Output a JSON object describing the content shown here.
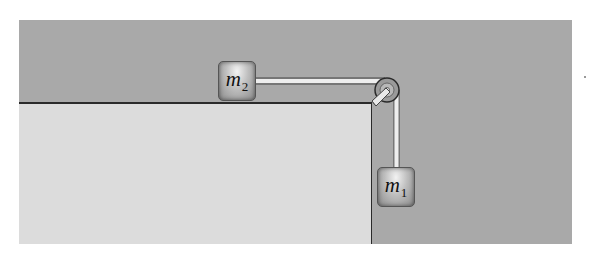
{
  "diagram": {
    "type": "pulley-system",
    "blocks": [
      {
        "id": "m2",
        "symbol": "m",
        "subscript": "2",
        "position": "on table surface"
      },
      {
        "id": "m1",
        "symbol": "m",
        "subscript": "1",
        "position": "hanging below pulley"
      }
    ],
    "colors": {
      "background": "#a9a9a9",
      "table": "#dcdcdc",
      "edge": "#2a2a2a"
    }
  }
}
